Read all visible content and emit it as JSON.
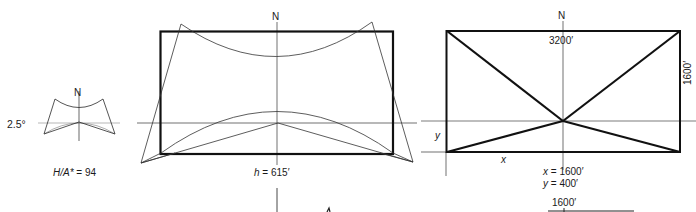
{
  "figure": {
    "panels": [
      {
        "id": "small-plan",
        "north_label": "N",
        "angle_label": "2.5°",
        "ratio_label_var": "H/A*",
        "ratio_label_eq": " = 94"
      },
      {
        "id": "middle-plan",
        "north_label": "N",
        "height_label_var": "h",
        "height_label_eq": " = 615′"
      },
      {
        "id": "right-plan",
        "north_label": "N",
        "top_dimension": "3200′",
        "side_dimension": "1600′",
        "x_var": "x",
        "y_var": "y",
        "x_value_var": "x",
        "x_value_eq": " = 1600′",
        "y_value_var": "y",
        "y_value_eq": " = 400′",
        "bottom_dimension": "1600′"
      }
    ],
    "colors": {
      "line": "#1a1a1a",
      "thin_line": "#3a3a3a",
      "background": "#ffffff"
    }
  }
}
